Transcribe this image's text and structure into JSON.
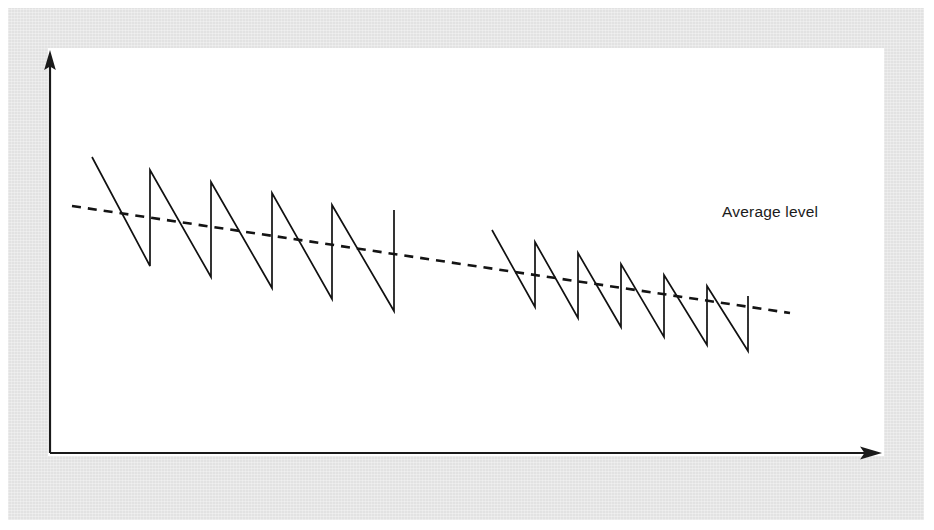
{
  "figure": {
    "background_color": "#ffffff",
    "frame_color": "#e2e2e2",
    "canvas_color": "#ffffff",
    "ink_color": "#111111",
    "annotations": [
      {
        "name": "average-level-label",
        "text": "Average level",
        "x": 722,
        "y": 217
      }
    ]
  },
  "chart_data": {
    "type": "line",
    "title": "",
    "xlabel": "",
    "ylabel": "",
    "grid": false,
    "legend": "none",
    "axes": {
      "x_axis": {
        "x_start": 50,
        "x_end": 880,
        "y": 453,
        "arrow": "right"
      },
      "y_axis": {
        "x": 50,
        "y_start": 453,
        "y_end": 52,
        "arrow": "up"
      },
      "xlim": [
        0,
        1
      ],
      "ylim": [
        0,
        1
      ],
      "tick_labels_x": [],
      "tick_labels_y": []
    },
    "series": [
      {
        "name": "sawtooth-burst-1",
        "description": "First decaying sawtooth burst: steep falling ramps separated by vertical recharge edges, peaks and troughs both drifting downward.",
        "points": [
          [
            92,
            157
          ],
          [
            150,
            266
          ],
          [
            150,
            170
          ],
          [
            211,
            277
          ],
          [
            211,
            182
          ],
          [
            272,
            288
          ],
          [
            272,
            193
          ],
          [
            332,
            299
          ],
          [
            332,
            205
          ],
          [
            394,
            311
          ],
          [
            394,
            210
          ]
        ]
      },
      {
        "name": "sawtooth-burst-2",
        "description": "Second decaying sawtooth burst after a quiet gap, lower amplitude, same downward drift.",
        "points": [
          [
            492,
            230
          ],
          [
            535,
            307
          ],
          [
            535,
            242
          ],
          [
            578,
            318
          ],
          [
            578,
            253
          ],
          [
            621,
            327
          ],
          [
            621,
            264
          ],
          [
            664,
            337
          ],
          [
            664,
            275
          ],
          [
            707,
            345
          ],
          [
            707,
            286
          ],
          [
            748,
            351
          ],
          [
            748,
            296
          ]
        ]
      },
      {
        "name": "average-level-trend",
        "description": "Dashed straight trend line showing the declining average level of the oscillation.",
        "style": "dashed",
        "points": [
          [
            72,
            206
          ],
          [
            790,
            313
          ]
        ]
      }
    ]
  }
}
